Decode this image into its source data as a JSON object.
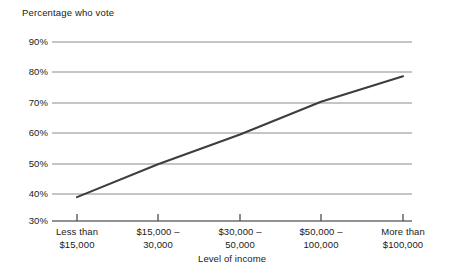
{
  "chart_data": {
    "type": "line",
    "title": "Percentage who vote",
    "xlabel": "Level of income",
    "ylabel": "",
    "categories": [
      "Less than $15,000",
      "$15,000 – 30,000",
      "$30,000 – 50,000",
      "$50,000 – 100,000",
      "More than $100,000"
    ],
    "category_lines": [
      [
        "Less than",
        "$15,000"
      ],
      [
        "$15,000 –",
        "30,000"
      ],
      [
        "$30,000 –",
        "50,000"
      ],
      [
        "$50,000 –",
        "100,000"
      ],
      [
        "More than",
        "$100,000"
      ]
    ],
    "values": [
      38,
      49,
      59,
      70,
      78.5
    ],
    "ylim": [
      30,
      90
    ],
    "ytick_labels": [
      "90%",
      "80%",
      "70%",
      "60%",
      "50%",
      "40%",
      "30%"
    ],
    "ytick_values": [
      90,
      80,
      70,
      60,
      50,
      40,
      30
    ],
    "grid": true,
    "legend": "none",
    "series_name": "Percentage who vote",
    "colors": {
      "line": "#3d3d3d",
      "grid": "#8c8c8c",
      "axis": "#6e6e6e",
      "text": "#1a1a1a",
      "background": "#ffffff"
    }
  }
}
